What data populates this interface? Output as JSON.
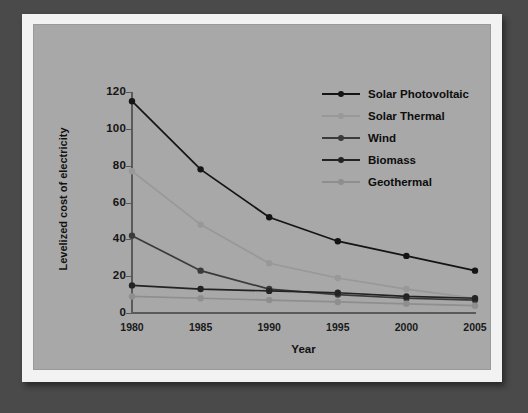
{
  "figure": {
    "background_color": "#4a4a4a",
    "mat_color": "#f2f2f2",
    "plot_background_color": "#a8a8a8"
  },
  "chart_data": {
    "type": "line",
    "title": "",
    "xlabel": "Year",
    "ylabel": "Levelized cost of electricity",
    "categories": [
      "1980",
      "1985",
      "1990",
      "1995",
      "2000",
      "2005"
    ],
    "x": [
      1980,
      1985,
      1990,
      1995,
      2000,
      2005
    ],
    "xlim": [
      1980,
      2005
    ],
    "ylim": [
      0,
      120
    ],
    "yticks": [
      0,
      20,
      40,
      60,
      80,
      100,
      120
    ],
    "ytick_labels": [
      "0",
      "20",
      "40",
      "60",
      "80",
      "100",
      "120"
    ],
    "grid": false,
    "legend_position": "upper right",
    "series": [
      {
        "name": "Solar Photovoltaic",
        "color": "#141414",
        "marker": "circle",
        "values": [
          115,
          78,
          52,
          39,
          31,
          23
        ]
      },
      {
        "name": "Solar Thermal",
        "color": "#989898",
        "marker": "circle",
        "values": [
          77,
          48,
          27,
          19,
          13,
          8
        ]
      },
      {
        "name": "Wind",
        "color": "#3a3a3a",
        "marker": "circle",
        "values": [
          42,
          23,
          13,
          10,
          8,
          7
        ]
      },
      {
        "name": "Biomass",
        "color": "#232323",
        "marker": "circle",
        "values": [
          15,
          13,
          12,
          11,
          9,
          8
        ]
      },
      {
        "name": "Geothermal",
        "color": "#8e8e8e",
        "marker": "circle",
        "values": [
          9,
          8,
          7,
          6,
          5,
          4
        ]
      }
    ]
  }
}
